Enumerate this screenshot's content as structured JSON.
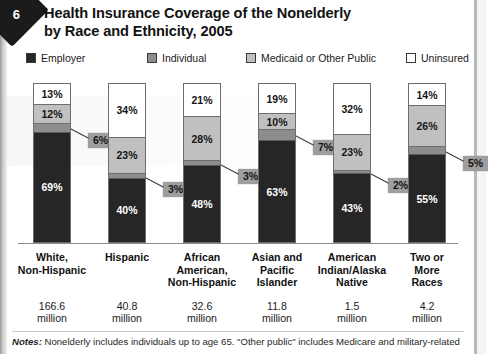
{
  "page": {
    "chapter_marker": "6"
  },
  "title": {
    "line1": "Health Insurance Coverage of the Nonelderly",
    "line2": "by Race and Ethnicity, 2005"
  },
  "legend": {
    "items": [
      {
        "label": "Employer",
        "color": "#262626",
        "left": 0
      },
      {
        "label": "Individual",
        "color": "#8d8d8d",
        "left": 121
      },
      {
        "label": "Medicaid or Other Public",
        "color": "#c0c0c0",
        "left": 220
      },
      {
        "label": "Uninsured",
        "color": "#ffffff",
        "left": 380
      }
    ]
  },
  "notes": {
    "lead": "Notes:",
    "text": " Nonelderly includes individuals up to age 65. \"Other public\" includes Medicare and military-related"
  },
  "chart_data": {
    "type": "bar",
    "subtype": "stacked-100-percent",
    "title": "Health Insurance Coverage of the Nonelderly by Race and Ethnicity, 2005",
    "xlabel": "",
    "ylabel": "",
    "ylim": [
      0,
      100
    ],
    "grid": false,
    "legend_position": "top",
    "value_suffix": "%",
    "categories": [
      "White,\nNon-Hispanic",
      "Hispanic",
      "African\nAmerican,\nNon-Hispanic",
      "Asian and\nPacific\nIslander",
      "American\nIndian/Alaska\nNative",
      "Two or\nMore\nRaces"
    ],
    "category_lines": [
      [
        "White,",
        "Non-Hispanic"
      ],
      [
        "Hispanic"
      ],
      [
        "African",
        "American,",
        "Non-Hispanic"
      ],
      [
        "Asian and",
        "Pacific",
        "Islander"
      ],
      [
        "American",
        "Indian/Alaska",
        "Native"
      ],
      [
        "Two or",
        "More",
        "Races"
      ]
    ],
    "population_labels": [
      [
        "166.6",
        "million"
      ],
      [
        "40.8",
        "million"
      ],
      [
        "32.6",
        "million"
      ],
      [
        "11.8",
        "million"
      ],
      [
        "1.5",
        "million"
      ],
      [
        "4.2",
        "million"
      ]
    ],
    "series": [
      {
        "name": "Employer",
        "color": "#262626",
        "values": [
          69,
          40,
          48,
          63,
          43,
          55
        ]
      },
      {
        "name": "Individual",
        "color": "#8d8d8d",
        "values": [
          6,
          3,
          3,
          7,
          2,
          5
        ]
      },
      {
        "name": "Medicaid or Other Public",
        "color": "#c0c0c0",
        "values": [
          12,
          23,
          28,
          10,
          23,
          26
        ]
      },
      {
        "name": "Uninsured",
        "color": "#ffffff",
        "values": [
          13,
          34,
          21,
          19,
          32,
          14
        ]
      }
    ],
    "value_labels": {
      "Employer": [
        "69%",
        "40%",
        "48%",
        "63%",
        "43%",
        "55%"
      ],
      "Individual": [
        "6%",
        "3%",
        "3%",
        "7%",
        "2%",
        "5%"
      ],
      "Medicaid or Other Public": [
        "12%",
        "23%",
        "28%",
        "10%",
        "23%",
        "26%"
      ],
      "Uninsured": [
        "13%",
        "34%",
        "21%",
        "19%",
        "32%",
        "14%"
      ]
    },
    "callout_series": "Individual",
    "bar_geometry": {
      "lefts": [
        33,
        108,
        183,
        258,
        333,
        408
      ],
      "width": 38,
      "top": 83,
      "height": 160
    }
  }
}
